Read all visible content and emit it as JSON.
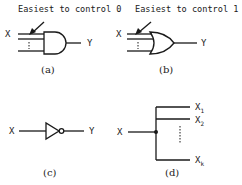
{
  "panel_a": {
    "title": "Easiest to control 0",
    "input_label": "X",
    "output_label": "Y",
    "gate": "AND",
    "caption": "(a)"
  },
  "panel_b": {
    "title": "Easiest to control 1",
    "input_label": "X",
    "output_label": "Y",
    "gate": "OR",
    "caption": "(b)"
  },
  "panel_c": {
    "input_label": "X",
    "output_label": "Y",
    "gate": "NOT",
    "caption": "(c)"
  },
  "panel_d": {
    "input_label": "X",
    "outputs": [
      {
        "base": "X",
        "sub": "1"
      },
      {
        "base": "X",
        "sub": "2"
      },
      {
        "base": "X",
        "sub": "k"
      }
    ],
    "ellipsis": "⋮",
    "element": "fanout",
    "caption": "(d)"
  },
  "colors": {
    "ink": "#1a1a1a",
    "background": "#ffffff"
  }
}
